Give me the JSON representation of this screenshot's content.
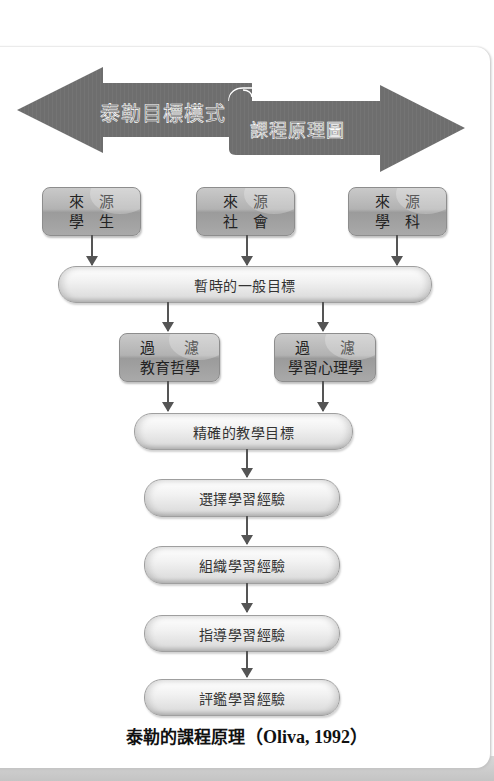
{
  "banner": {
    "left_arrow_text": "泰勒目標模式",
    "right_arrow_text": "課程原理圖",
    "arrow_color": "#6e6e6e"
  },
  "sources": [
    {
      "top_left": "來",
      "top_right": "源",
      "bottom_left": "學",
      "bottom_right": "生"
    },
    {
      "top_left": "來",
      "top_right": "源",
      "bottom_left": "社",
      "bottom_right": "會"
    },
    {
      "top_left": "來",
      "top_right": "源",
      "bottom_left": "學",
      "bottom_right": "科"
    }
  ],
  "tentative_objectives": "暫時的一般目標",
  "filters": [
    {
      "top_left": "過",
      "top_right": "濾",
      "bottom": "教育哲學"
    },
    {
      "top_left": "過",
      "top_right": "濾",
      "bottom": "學習心理學"
    }
  ],
  "precise_objectives": "精確的教學目標",
  "steps": [
    "選擇學習經驗",
    "組織學習經驗",
    "指導學習經驗",
    "評鑑學習經驗"
  ],
  "caption": {
    "title": "泰勒的課程原理",
    "citation": "（Oliva, 1992）"
  },
  "colors": {
    "box_gray": "#b0b0b0",
    "connector": "#555555"
  }
}
